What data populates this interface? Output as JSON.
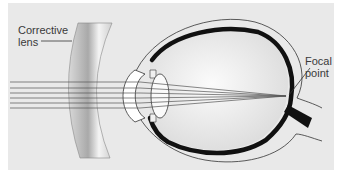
{
  "diagram": {
    "labels": {
      "corrective_lens_line1": "Corrective",
      "corrective_lens_line2": "lens",
      "focal_point_line1": "Focal",
      "focal_point_line2": "point"
    },
    "colors": {
      "background": "#e9e9e9",
      "outer_margin": "#ffffff",
      "eye_wall": "#111111",
      "lens_fill": "#ffffff",
      "rays": "#555555",
      "corrective_lens": "#bdbdbd"
    },
    "components": [
      "corrective-lens",
      "light-rays",
      "cornea",
      "iris",
      "crystalline-lens",
      "eyeball",
      "retina",
      "optic-nerve",
      "focal-point"
    ]
  }
}
